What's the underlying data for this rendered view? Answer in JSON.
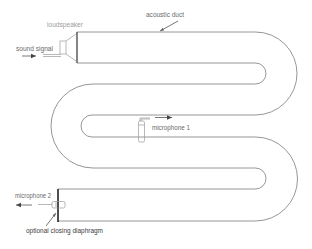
{
  "diagram": {
    "labels": {
      "acoustic_duct": "acoustic duct",
      "loudspeaker": "loudspeaker",
      "sound_signal": "sound signal",
      "microphone_1": "microphone 1",
      "microphone_2": "microphone 2",
      "closing_diaphragm": "optional closing diaphragm"
    },
    "components": [
      {
        "id": "loudspeaker",
        "position": "duct inlet, top-left"
      },
      {
        "id": "acoustic-duct",
        "shape": "serpentine, 4 straight runs, 3 U-turns"
      },
      {
        "id": "microphone-1",
        "position": "mid-duct, third run"
      },
      {
        "id": "microphone-2",
        "position": "duct outlet, bottom-left"
      },
      {
        "id": "closing-diaphragm",
        "position": "duct outlet, optional"
      }
    ],
    "colors": {
      "duct_wall": "#8a8a8a",
      "end_wall": "#333333",
      "label_text": "#6a6a6a",
      "background": "#ffffff"
    }
  }
}
